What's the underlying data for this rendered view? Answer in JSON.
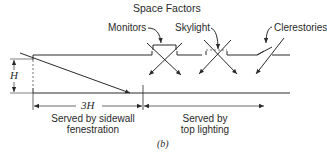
{
  "figure": {
    "title": "Space Factors",
    "caption": "(b)",
    "labels": {
      "monitors": "Monitors",
      "skylight": "Skylight",
      "clerestories": "Clerestories",
      "height": "H",
      "depth": "3H",
      "sidewall_line1": "Served by sidewall",
      "sidewall_line2": "fenestration",
      "top_line1": "Served by",
      "top_line2": "top lighting"
    },
    "colors": {
      "line": "#2a2a2a",
      "dashed": "#777777"
    }
  }
}
